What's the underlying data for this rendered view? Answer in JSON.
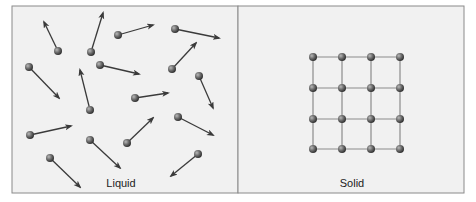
{
  "panels": {
    "liquid": {
      "label": "Liquid",
      "molecules": [
        {
          "x": 58,
          "y": 51,
          "tx": 44,
          "ty": 22
        },
        {
          "x": 91,
          "y": 52,
          "tx": 103,
          "ty": 13
        },
        {
          "x": 118,
          "y": 35,
          "tx": 153,
          "ty": 25
        },
        {
          "x": 175,
          "y": 29,
          "tx": 219,
          "ty": 38
        },
        {
          "x": 29,
          "y": 67,
          "tx": 59,
          "ty": 98
        },
        {
          "x": 100,
          "y": 65,
          "tx": 139,
          "ty": 74
        },
        {
          "x": 172,
          "y": 69,
          "tx": 196,
          "ty": 43
        },
        {
          "x": 199,
          "y": 76,
          "tx": 213,
          "ty": 108
        },
        {
          "x": 90,
          "y": 110,
          "tx": 80,
          "ty": 70
        },
        {
          "x": 135,
          "y": 98,
          "tx": 168,
          "ty": 93
        },
        {
          "x": 30,
          "y": 135,
          "tx": 71,
          "ty": 126
        },
        {
          "x": 90,
          "y": 140,
          "tx": 120,
          "ty": 168
        },
        {
          "x": 127,
          "y": 143,
          "tx": 153,
          "ty": 118
        },
        {
          "x": 178,
          "y": 117,
          "tx": 213,
          "ty": 135
        },
        {
          "x": 50,
          "y": 158,
          "tx": 80,
          "ty": 187
        },
        {
          "x": 198,
          "y": 154,
          "tx": 171,
          "ty": 176
        }
      ]
    },
    "solid": {
      "label": "Solid",
      "grid": {
        "cols": [
          313,
          342,
          371,
          400
        ],
        "rows": [
          57,
          88,
          119,
          149
        ]
      }
    }
  },
  "colors": {
    "background": "#f1f1f1",
    "border": "#8a8a8a",
    "molecule": "#6a6a6a",
    "arrow": "#3a3a3a",
    "bond": "#8c8c8c"
  }
}
